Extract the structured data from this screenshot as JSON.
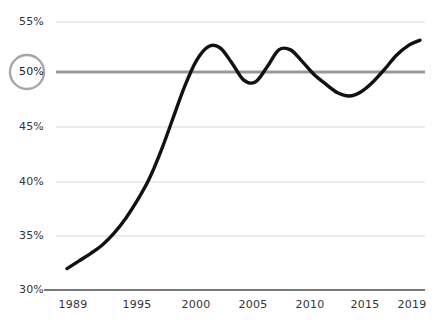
{
  "chart_data": {
    "type": "line",
    "title": "",
    "subtitle": "",
    "xlabel": "",
    "ylabel": "",
    "xlim": [
      1989,
      2019
    ],
    "ylim": [
      30,
      55
    ],
    "grid": true,
    "legend": null,
    "x_tick_labels": [
      "1989",
      "1995",
      "2000",
      "2005",
      "2010",
      "2015",
      "2019"
    ],
    "x_ticks": [
      1989,
      1995,
      2000,
      2005,
      2010,
      2015,
      2019
    ],
    "y_tick_labels": [
      "30%",
      "35%",
      "40%",
      "45%",
      "50%",
      "55%"
    ],
    "y_ticks": [
      30,
      35,
      40,
      45,
      50,
      55
    ],
    "highlighted_y_value": 50,
    "highlighted_y_label": "50%",
    "series": [
      {
        "name": "share",
        "color": "#111111",
        "x": [
          1989,
          1990,
          1991,
          1992,
          1993,
          1994,
          1995,
          1996,
          1997,
          1998,
          1999,
          2000,
          2001,
          2002,
          2003,
          2004,
          2005,
          2006,
          2007,
          2008,
          2009,
          2010,
          2011,
          2012,
          2013,
          2014,
          2015,
          2016,
          2017,
          2018,
          2019
        ],
        "values": [
          32.0,
          32.7,
          33.4,
          34.2,
          35.3,
          36.7,
          38.4,
          40.4,
          43.0,
          46.0,
          49.0,
          51.4,
          52.7,
          52.6,
          51.2,
          49.6,
          49.4,
          50.8,
          52.4,
          52.4,
          51.3,
          50.1,
          49.2,
          48.4,
          48.1,
          48.5,
          49.4,
          50.6,
          51.9,
          52.8,
          53.3
        ]
      }
    ],
    "annotations": [
      {
        "type": "axis-marker-circle",
        "target": "50%",
        "color": "#a6a6a6"
      },
      {
        "type": "reference-line",
        "value": 50,
        "color": "#999999",
        "width": 3
      }
    ]
  },
  "style": {
    "background": "#ffffff",
    "grid_color": "#d9d9d9",
    "axis_color": "#4d4d4d",
    "line_color": "#111111",
    "reference_line_color": "#999999",
    "circle_marker_color": "#a6a6a6",
    "tick_text_color": "#333333"
  }
}
